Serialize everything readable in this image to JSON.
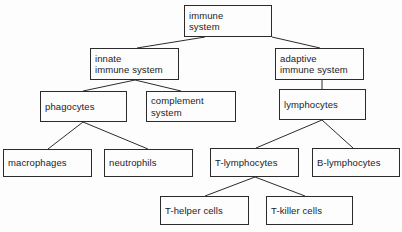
{
  "diagram": {
    "type": "tree",
    "background_color": "#fdfdfd",
    "line_color": "#2b2b2b",
    "text_color": "#1c1c1c",
    "nodes": [
      {
        "id": "immune-system",
        "label": "immune\nsystem",
        "x": 184,
        "y": 5,
        "w": 88,
        "h": 32,
        "level": 0
      },
      {
        "id": "innate-immune-system",
        "label": "innate\nimmune system",
        "x": 90,
        "y": 48,
        "w": 89,
        "h": 32,
        "level": 1
      },
      {
        "id": "adaptive-immune-system",
        "label": "adaptive\nimmune system",
        "x": 275,
        "y": 48,
        "w": 89,
        "h": 32,
        "level": 1
      },
      {
        "id": "phagocytes",
        "label": "phagocytes",
        "x": 40,
        "y": 91,
        "w": 87,
        "h": 31,
        "level": 2
      },
      {
        "id": "complement-system",
        "label": "complement\nsystem",
        "x": 146,
        "y": 91,
        "w": 90,
        "h": 31,
        "level": 2
      },
      {
        "id": "lymphocytes",
        "label": "lymphocytes",
        "x": 279,
        "y": 89,
        "w": 87,
        "h": 31,
        "level": 2
      },
      {
        "id": "macrophages",
        "label": "macrophages",
        "x": 3,
        "y": 149,
        "w": 89,
        "h": 28,
        "level": 3
      },
      {
        "id": "neutrophils",
        "label": "neutrophils",
        "x": 104,
        "y": 149,
        "w": 89,
        "h": 28,
        "level": 3
      },
      {
        "id": "t-lymphocytes",
        "label": "T-lymphocytes",
        "x": 210,
        "y": 148,
        "w": 89,
        "h": 29,
        "level": 3
      },
      {
        "id": "b-lymphocytes",
        "label": "B-lymphocytes",
        "x": 312,
        "y": 148,
        "w": 88,
        "h": 29,
        "level": 3
      },
      {
        "id": "t-helper-cells",
        "label": "T-helper cells",
        "x": 160,
        "y": 196,
        "w": 89,
        "h": 29,
        "level": 4
      },
      {
        "id": "t-killer-cells",
        "label": "T-killer cells",
        "x": 266,
        "y": 196,
        "w": 87,
        "h": 29,
        "level": 4
      }
    ],
    "edges": [
      {
        "from": "immune-system",
        "to": "innate-immune-system",
        "x1": 205,
        "y1": 37,
        "x2": 137,
        "y2": 48
      },
      {
        "from": "immune-system",
        "to": "adaptive-immune-system",
        "x1": 272,
        "y1": 37,
        "x2": 320,
        "y2": 48
      },
      {
        "from": "innate-immune-system",
        "to": "phagocytes",
        "x1": 135,
        "y1": 80,
        "x2": 83,
        "y2": 91
      },
      {
        "from": "innate-immune-system",
        "to": "complement-system",
        "x1": 135,
        "y1": 80,
        "x2": 181,
        "y2": 91
      },
      {
        "from": "adaptive-immune-system",
        "to": "lymphocytes",
        "x1": 322,
        "y1": 80,
        "x2": 322,
        "y2": 89
      },
      {
        "from": "phagocytes",
        "to": "macrophages",
        "x1": 83,
        "y1": 122,
        "x2": 48,
        "y2": 149
      },
      {
        "from": "phagocytes",
        "to": "neutrophils",
        "x1": 83,
        "y1": 122,
        "x2": 148,
        "y2": 149
      },
      {
        "from": "lymphocytes",
        "to": "t-lymphocytes",
        "x1": 322,
        "y1": 120,
        "x2": 256,
        "y2": 148
      },
      {
        "from": "lymphocytes",
        "to": "b-lymphocytes",
        "x1": 322,
        "y1": 120,
        "x2": 353,
        "y2": 148
      },
      {
        "from": "t-lymphocytes",
        "to": "t-helper-cells",
        "x1": 255,
        "y1": 177,
        "x2": 205,
        "y2": 196
      },
      {
        "from": "t-lymphocytes",
        "to": "t-killer-cells",
        "x1": 255,
        "y1": 177,
        "x2": 305,
        "y2": 196
      }
    ]
  }
}
